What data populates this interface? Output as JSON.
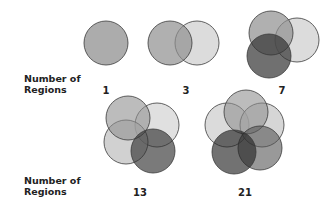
{
  "row_label_line1": "Number of",
  "row_label_line2": "Regions",
  "rows": [
    {
      "label1": "Number of",
      "label2": "Regions",
      "counts": [
        "1",
        "3",
        "7"
      ]
    },
    {
      "label1": "Number of",
      "label2": "Regions",
      "counts": [
        "13",
        "21"
      ]
    }
  ],
  "colors": {
    "light": "#d3d3d3",
    "medium": "#a6a6a6",
    "dark": "#555555",
    "stroke": "#3a3a3a"
  }
}
